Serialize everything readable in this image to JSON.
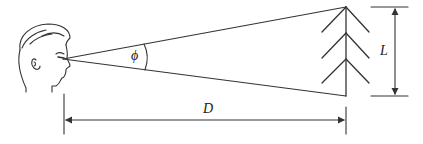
{
  "diagram": {
    "labels": {
      "angle": "ϕ",
      "height": "L",
      "distance": "D"
    },
    "colors": {
      "line": "#333333",
      "background": "#ffffff"
    }
  }
}
